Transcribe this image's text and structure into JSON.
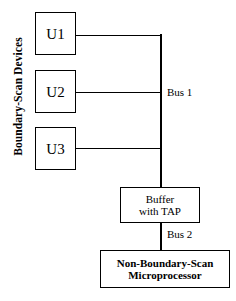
{
  "diagram": {
    "side_label": "Boundary-Scan Devices",
    "devices": [
      {
        "id": "U1",
        "label": "U1"
      },
      {
        "id": "U2",
        "label": "U2"
      },
      {
        "id": "U3",
        "label": "U3"
      }
    ],
    "buffer": {
      "line1": "Buffer",
      "line2": "with TAP"
    },
    "microprocessor": {
      "line1": "Non-Boundary-Scan",
      "line2": "Microprocessor"
    },
    "buses": [
      {
        "id": "bus1",
        "label": "Bus 1"
      },
      {
        "id": "bus2",
        "label": "Bus 2"
      }
    ],
    "colors": {
      "background": "#ffffff",
      "stroke": "#000000",
      "text": "#000000"
    }
  }
}
